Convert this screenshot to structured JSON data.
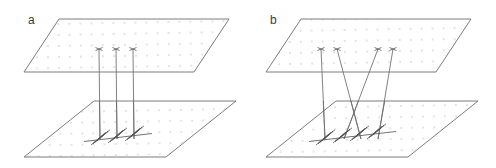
{
  "figure": {
    "type": "schematic-diagram",
    "canvas": {
      "width": 496,
      "height": 168,
      "background": "#ffffff"
    },
    "stroke_color": "#5a5a5a",
    "thread_color": "#6b6b6b",
    "coil_color": "#555555",
    "dot_color": "#e9dcdc",
    "label_color": "#3a3a3a"
  },
  "panels": [
    {
      "id": "a",
      "label": "a",
      "label_pos": {
        "x": 28,
        "y": 24
      },
      "caption_note": "Parallel (uncrossed) tethers: three straight vertical threads run from the upper plane down to three coils on the lower plane.",
      "upper_plane": {
        "name": "upper-plane",
        "points": [
          [
            59,
            19
          ],
          [
            229,
            19
          ],
          [
            194,
            72
          ],
          [
            24,
            72
          ]
        ],
        "fill": "#ffffff",
        "dotted": true
      },
      "lower_plane": {
        "name": "lower-plane",
        "points": [
          [
            94,
            101
          ],
          [
            236,
            101
          ],
          [
            166,
            157
          ],
          [
            24,
            157
          ]
        ],
        "fill": "#ffffff",
        "dotted": true
      },
      "anchors_top": [
        {
          "x": 99,
          "y": 49
        },
        {
          "x": 116,
          "y": 49
        },
        {
          "x": 133,
          "y": 49
        }
      ],
      "anchors_bottom": [
        {
          "x": 100,
          "y": 139
        },
        {
          "x": 117,
          "y": 139
        },
        {
          "x": 134,
          "y": 139
        }
      ],
      "tethers": [
        {
          "x1": 99,
          "y1": 49,
          "x2": 100,
          "y2": 139
        },
        {
          "x1": 116,
          "y1": 49,
          "x2": 117,
          "y2": 139
        },
        {
          "x1": 133,
          "y1": 49,
          "x2": 134,
          "y2": 139
        }
      ],
      "coils": [
        {
          "cx": 100,
          "cy": 139
        },
        {
          "cx": 117,
          "cy": 139
        },
        {
          "cx": 134,
          "cy": 139
        }
      ],
      "coil_baseline": {
        "x1": 84,
        "y1": 141,
        "x2": 152,
        "y2": 133
      }
    },
    {
      "id": "b",
      "label": "b",
      "label_pos": {
        "x": 270,
        "y": 24
      },
      "caption_note": "Crossed tethers: four oblique threads run from the upper plane down to four coils on the lower plane, crossing one another in between.",
      "upper_plane": {
        "name": "upper-plane",
        "points": [
          [
            301,
            19
          ],
          [
            471,
            19
          ],
          [
            436,
            72
          ],
          [
            266,
            72
          ]
        ],
        "fill": "#ffffff",
        "dotted": true
      },
      "lower_plane": {
        "name": "lower-plane",
        "points": [
          [
            336,
            101
          ],
          [
            478,
            101
          ],
          [
            408,
            157
          ],
          [
            266,
            157
          ]
        ],
        "fill": "#ffffff",
        "dotted": true
      },
      "anchors_top": [
        {
          "x": 321,
          "y": 49
        },
        {
          "x": 337,
          "y": 49
        },
        {
          "x": 378,
          "y": 49
        },
        {
          "x": 393,
          "y": 49
        }
      ],
      "anchors_bottom": [
        {
          "x": 325,
          "y": 139
        },
        {
          "x": 344,
          "y": 139
        },
        {
          "x": 361,
          "y": 139
        },
        {
          "x": 378,
          "y": 139
        }
      ],
      "tethers": [
        {
          "x1": 321,
          "y1": 49,
          "x2": 325,
          "y2": 139
        },
        {
          "x1": 337,
          "y1": 49,
          "x2": 361,
          "y2": 139
        },
        {
          "x1": 378,
          "y1": 49,
          "x2": 344,
          "y2": 139
        },
        {
          "x1": 393,
          "y1": 49,
          "x2": 378,
          "y2": 139
        }
      ],
      "coils": [
        {
          "cx": 325,
          "cy": 139
        },
        {
          "cx": 344,
          "cy": 139
        },
        {
          "cx": 361,
          "cy": 139
        },
        {
          "cx": 378,
          "cy": 139
        }
      ],
      "coil_baseline": {
        "x1": 309,
        "y1": 141,
        "x2": 396,
        "y2": 131
      }
    }
  ]
}
